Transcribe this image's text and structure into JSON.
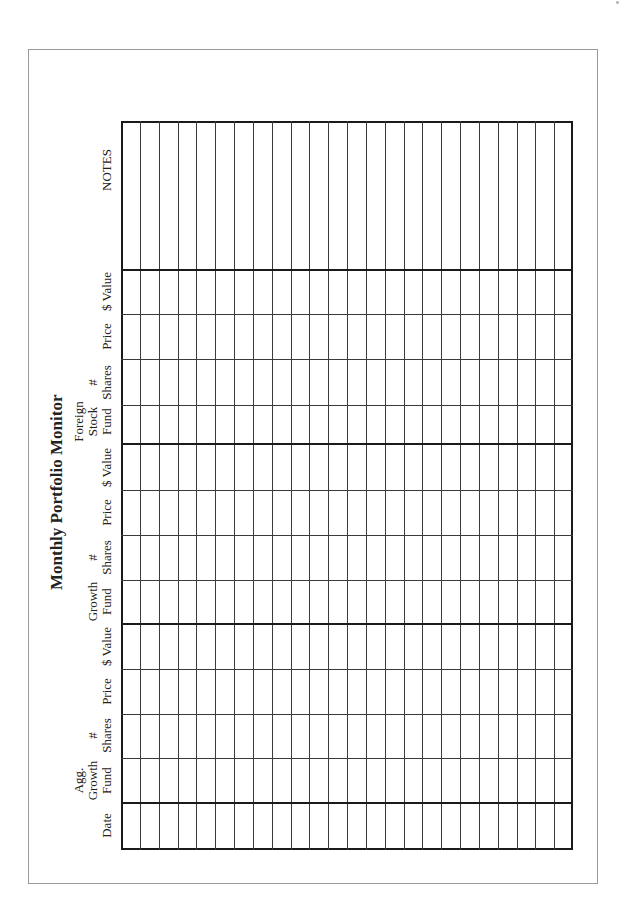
{
  "document": {
    "title": "Monthly Portfolio Monitor",
    "orientation": "landscape-rotated-90ccw",
    "columns": [
      {
        "id": "date",
        "label": "Date"
      },
      {
        "id": "agg-growth-fund",
        "label": "Agg.\nGrowth\nFund"
      },
      {
        "id": "agg-growth-shares",
        "label": "#\nShares"
      },
      {
        "id": "agg-growth-price",
        "label": "Price"
      },
      {
        "id": "agg-growth-value",
        "label": "$ Value"
      },
      {
        "id": "growth-fund",
        "label": "Growth\nFund"
      },
      {
        "id": "growth-shares",
        "label": "#\nShares"
      },
      {
        "id": "growth-price",
        "label": "Price"
      },
      {
        "id": "growth-value",
        "label": "$ Value"
      },
      {
        "id": "foreign-stock-fund",
        "label": "Foreign\nStock\nFund"
      },
      {
        "id": "foreign-shares",
        "label": "#\nShares"
      },
      {
        "id": "foreign-price",
        "label": "Price"
      },
      {
        "id": "foreign-value",
        "label": "$ Value"
      },
      {
        "id": "notes",
        "label": "NOTES"
      }
    ],
    "row_count": 24,
    "colors": {
      "grid": "#1a1a1a",
      "thin_rule": "#3a3a3a",
      "page_border": "#9a9a9a",
      "background": "#ffffff"
    }
  }
}
